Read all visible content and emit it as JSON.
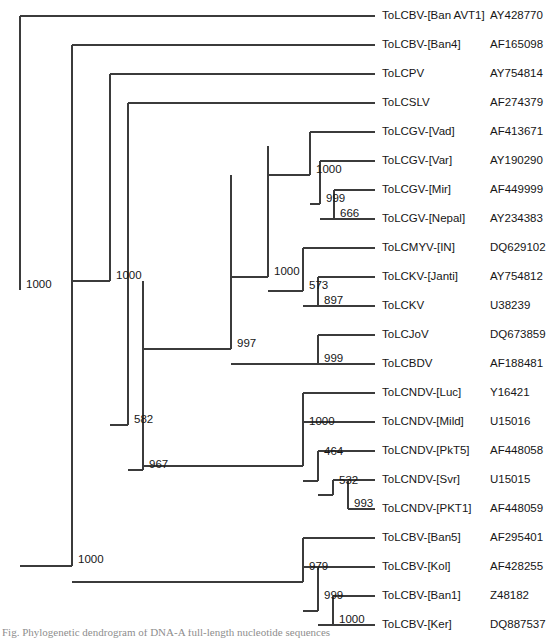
{
  "figure": {
    "type": "phylogenetic-tree",
    "layout": "rectangular-cladogram",
    "caption": "Fig. Phylogenetic dendrogram of DNA-A full-length nucleotide sequences",
    "leaf_count": 20,
    "support_label_kind": "bootstrap"
  },
  "leaves": [
    {
      "index": 0,
      "name": "ToLCBV-[Ban AVT1]",
      "accession": "AY428770",
      "y": 16
    },
    {
      "index": 1,
      "name": "ToLCBV-[Ban4]",
      "accession": "AF165098",
      "y": 45
    },
    {
      "index": 2,
      "name": "ToLCPV",
      "accession": "AY754814",
      "y": 74
    },
    {
      "index": 3,
      "name": "ToLCSLV",
      "accession": "AF274379",
      "y": 103
    },
    {
      "index": 4,
      "name": "ToLCGV-[Vad]",
      "accession": "AF413671",
      "y": 132
    },
    {
      "index": 5,
      "name": "ToLCGV-[Var]",
      "accession": "AY190290",
      "y": 161
    },
    {
      "index": 6,
      "name": "ToLCGV-[Mir]",
      "accession": "AF449999",
      "y": 190
    },
    {
      "index": 7,
      "name": "ToLCGV-[Nepal]",
      "accession": "AY234383",
      "y": 219
    },
    {
      "index": 8,
      "name": "ToLCMYV-[IN]",
      "accession": "DQ629102",
      "y": 248
    },
    {
      "index": 9,
      "name": "ToLCKV-[Janti]",
      "accession": "AY754812",
      "y": 277
    },
    {
      "index": 10,
      "name": "ToLCKV",
      "accession": "U38239",
      "y": 306
    },
    {
      "index": 11,
      "name": "ToLCJoV",
      "accession": "DQ673859",
      "y": 335
    },
    {
      "index": 12,
      "name": "ToLCBDV",
      "accession": "AF188481",
      "y": 364
    },
    {
      "index": 13,
      "name": "ToLCNDV-[Luc]",
      "accession": "Y16421",
      "y": 393
    },
    {
      "index": 14,
      "name": "ToLCNDV-[Mild]",
      "accession": "U15016",
      "y": 422
    },
    {
      "index": 15,
      "name": "ToLCNDV-[PkT5]",
      "accession": "AF448058",
      "y": 451
    },
    {
      "index": 16,
      "name": "ToLCNDV-[Svr]",
      "accession": "U15015",
      "y": 480
    },
    {
      "index": 17,
      "name": "ToLCNDV-[PKT1]",
      "accession": "AF448059",
      "y": 509
    },
    {
      "index": 18,
      "name": "ToLCBV-[Ban5]",
      "accession": "AF295401",
      "y": 538
    },
    {
      "index": 19,
      "name": "ToLCBV-[Kol]",
      "accession": "AF428255",
      "y": 567
    },
    {
      "index": 20,
      "name": "ToLCBV-[Ban1]",
      "accession": "Z48182",
      "y": 596
    },
    {
      "index": 21,
      "name": "ToLCBV-[Ker]",
      "accession": "DQ887537",
      "y": 625
    }
  ],
  "nodes": [
    {
      "id": "root",
      "support": "1000",
      "x": 20,
      "y_top": 16,
      "y_bot": 290,
      "label_x": 26,
      "label_y": 285
    },
    {
      "id": "n2",
      "support": "1000",
      "x": 72,
      "y_top": 45,
      "y_bot": 566,
      "label_x": 78,
      "label_y": 560
    },
    {
      "id": "n3",
      "support": "1000",
      "x": 110,
      "y_top": 74,
      "y_bot": 281,
      "label_x": 116,
      "label_y": 276
    },
    {
      "id": "n4",
      "support": "582",
      "x": 128,
      "y_top": 103,
      "y_bot": 425,
      "label_x": 134,
      "label_y": 420
    },
    {
      "id": "n5",
      "support": "967",
      "x": 143,
      "y_top": 281,
      "y_bot": 470,
      "label_x": 149,
      "label_y": 465
    },
    {
      "id": "n6",
      "support": "997",
      "x": 231,
      "y_top": 175,
      "y_bot": 349,
      "label_x": 237,
      "label_y": 344
    },
    {
      "id": "n7",
      "support": "1000",
      "x": 268,
      "y_top": 146,
      "y_bot": 277,
      "label_x": 274,
      "label_y": 272
    },
    {
      "id": "n8",
      "support": "1000",
      "x": 310,
      "y_top": 132,
      "y_bot": 175,
      "label_x": 316,
      "label_y": 170
    },
    {
      "id": "n9",
      "support": "999",
      "x": 320,
      "y_top": 161,
      "y_bot": 204,
      "label_x": 326,
      "label_y": 199
    },
    {
      "id": "n10",
      "support": "666",
      "x": 334,
      "y_top": 190,
      "y_bot": 219,
      "label_x": 340,
      "label_y": 214
    },
    {
      "id": "n11",
      "support": "573",
      "x": 303,
      "y_top": 248,
      "y_bot": 291,
      "label_x": 309,
      "label_y": 286
    },
    {
      "id": "n12",
      "support": "897",
      "x": 318,
      "y_top": 277,
      "y_bot": 306,
      "label_x": 324,
      "label_y": 301
    },
    {
      "id": "n13",
      "support": "999",
      "x": 318,
      "y_top": 335,
      "y_bot": 364,
      "label_x": 324,
      "label_y": 359
    },
    {
      "id": "n14",
      "support": "1000",
      "x": 303,
      "y_top": 393,
      "y_bot": 466,
      "label_x": 309,
      "label_y": 422
    },
    {
      "id": "n15",
      "support": "464",
      "x": 318,
      "y_top": 451,
      "y_bot": 481,
      "label_x": 324,
      "label_y": 452
    },
    {
      "id": "n16",
      "support": "532",
      "x": 333,
      "y_top": 480,
      "y_bot": 495,
      "label_x": 339,
      "label_y": 481
    },
    {
      "id": "n17",
      "support": "993",
      "x": 348,
      "y_top": 480,
      "y_bot": 509,
      "label_x": 354,
      "label_y": 504
    },
    {
      "id": "n18",
      "support": "979",
      "x": 303,
      "y_top": 538,
      "y_bot": 582,
      "label_x": 309,
      "label_y": 567
    },
    {
      "id": "n19",
      "support": "999",
      "x": 318,
      "y_top": 567,
      "y_bot": 611,
      "label_x": 324,
      "label_y": 596
    },
    {
      "id": "n20",
      "support": "1000",
      "x": 333,
      "y_top": 596,
      "y_bot": 625,
      "label_x": 339,
      "label_y": 620
    }
  ],
  "geometry": {
    "leaf_tip_x": 375,
    "taxon_text_x": 382,
    "accession_text_x": 490
  }
}
